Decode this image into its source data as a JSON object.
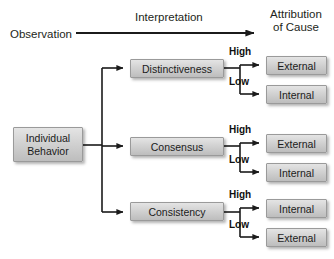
{
  "diagram": {
    "header": {
      "source_label": "Observation",
      "process_label": "Interpretation",
      "result_label": "Attribution\nof Cause"
    },
    "root": {
      "label": "Individual\nBehavior"
    },
    "criteria": [
      {
        "label": "Distinctiveness",
        "branches": [
          {
            "level": "High",
            "outcome": "External"
          },
          {
            "level": "Low",
            "outcome": "Internal"
          }
        ]
      },
      {
        "label": "Consensus",
        "branches": [
          {
            "level": "High",
            "outcome": "External"
          },
          {
            "level": "Low",
            "outcome": "Internal"
          }
        ]
      },
      {
        "label": "Consistency",
        "branches": [
          {
            "level": "High",
            "outcome": "Internal"
          },
          {
            "level": "Low",
            "outcome": "External"
          }
        ]
      }
    ],
    "colors": {
      "box_fill_top": "#e4e4e4",
      "box_fill_bottom": "#bdbdbd",
      "box_border": "#9a9a9a",
      "line": "#1b1b1b",
      "text": "#231f20",
      "background": "#ffffff"
    }
  }
}
